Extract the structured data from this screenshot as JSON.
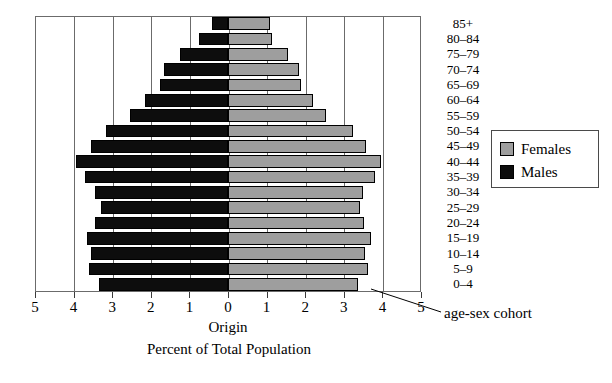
{
  "chart_data": {
    "type": "bar",
    "subtype": "population-pyramid",
    "title": "",
    "xlabel": "Percent of Total Population",
    "ylabel": "",
    "origin_label": "Origin",
    "annotation": "age-sex cohort",
    "grid": true,
    "legend_position": "right",
    "xlim": [
      -5,
      5
    ],
    "x_tick_labels": [
      "5",
      "4",
      "3",
      "2",
      "1",
      "0",
      "1",
      "2",
      "3",
      "4",
      "5"
    ],
    "x_tick_values": [
      -5,
      -4,
      -3,
      -2,
      -1,
      0,
      1,
      2,
      3,
      4,
      5
    ],
    "categories": [
      "85+",
      "80–84",
      "75–79",
      "70–74",
      "65–69",
      "60–64",
      "55–59",
      "50–54",
      "45–49",
      "40–44",
      "35–39",
      "30–34",
      "25–29",
      "20–24",
      "15–19",
      "10–14",
      "5–9",
      "0–4"
    ],
    "series": [
      {
        "name": "Males",
        "color": "#0d0d0d",
        "values": [
          0.42,
          0.75,
          1.25,
          1.65,
          1.75,
          2.15,
          2.55,
          3.15,
          3.55,
          3.94,
          3.7,
          3.45,
          3.3,
          3.45,
          3.65,
          3.55,
          3.6,
          3.35
        ]
      },
      {
        "name": "Females",
        "color": "#9e9e9e",
        "values": [
          1.09,
          1.15,
          1.55,
          1.85,
          1.9,
          2.2,
          2.55,
          3.25,
          3.58,
          3.96,
          3.8,
          3.5,
          3.42,
          3.52,
          3.7,
          3.55,
          3.62,
          3.38
        ]
      }
    ]
  },
  "legend": {
    "items": [
      {
        "label": "Females",
        "color": "#9e9e9e"
      },
      {
        "label": "Males",
        "color": "#0d0d0d"
      }
    ]
  },
  "colors": {
    "male": "#0d0d0d",
    "female": "#9e9e9e",
    "grid": "#6b6b6b",
    "frame": "#6b6b6b",
    "background": "#ffffff",
    "text": "#000000"
  }
}
